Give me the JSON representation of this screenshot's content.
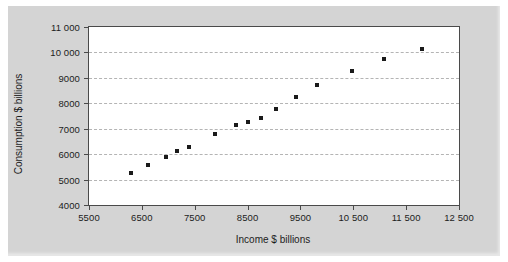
{
  "chart_data": {
    "type": "scatter",
    "title": "",
    "xlabel": "Income $ billions",
    "ylabel": "Consumption $ billions",
    "xlim": [
      5500,
      12500
    ],
    "ylim": [
      4000,
      11000
    ],
    "xticks": [
      5500,
      6500,
      7500,
      8500,
      9500,
      10500,
      11500,
      12500
    ],
    "xtick_labels": [
      "5500",
      "6500",
      "7500",
      "8500",
      "9500",
      "10 500",
      "11 500",
      "12 500"
    ],
    "yticks": [
      4000,
      5000,
      6000,
      7000,
      8000,
      9000,
      10000,
      11000
    ],
    "ytick_labels": [
      "4000",
      "5000",
      "6000",
      "7000",
      "8000",
      "9000",
      "10 000",
      "11 000"
    ],
    "grid": "horizontal-dashed",
    "legend": "none",
    "marker": "filled-square",
    "marker_color": "#1a1a1a",
    "plot_background": "#ffffff",
    "figure_background": "#d4d4d4",
    "x": [
      6300,
      6620,
      6960,
      7160,
      7400,
      7880,
      8280,
      8500,
      8760,
      9040,
      9420,
      9820,
      10480,
      11080,
      11800
    ],
    "y": [
      5240,
      5560,
      5900,
      6110,
      6300,
      6800,
      7130,
      7280,
      7410,
      7760,
      8250,
      8700,
      9270,
      9740,
      10130
    ],
    "points": [
      {
        "x": 6300,
        "y": 5240
      },
      {
        "x": 6620,
        "y": 5560
      },
      {
        "x": 6960,
        "y": 5900
      },
      {
        "x": 7160,
        "y": 6110
      },
      {
        "x": 7400,
        "y": 6300
      },
      {
        "x": 7880,
        "y": 6800
      },
      {
        "x": 8280,
        "y": 7130
      },
      {
        "x": 8500,
        "y": 7280
      },
      {
        "x": 8760,
        "y": 7410
      },
      {
        "x": 9040,
        "y": 7760
      },
      {
        "x": 9420,
        "y": 8250
      },
      {
        "x": 9820,
        "y": 8700
      },
      {
        "x": 10480,
        "y": 9270
      },
      {
        "x": 11080,
        "y": 9740
      },
      {
        "x": 11800,
        "y": 10130
      }
    ]
  }
}
